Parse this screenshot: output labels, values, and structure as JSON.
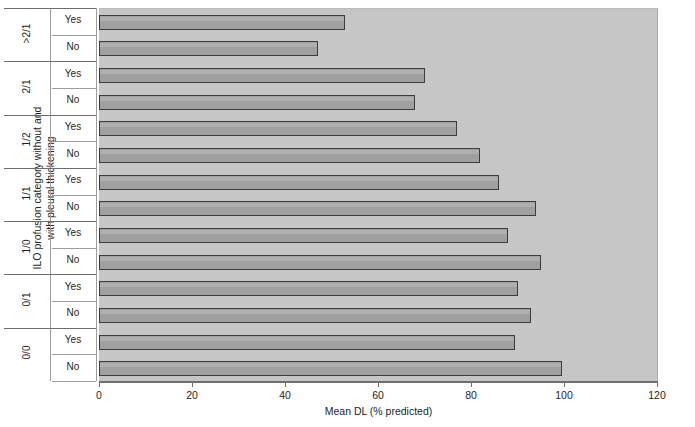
{
  "chart_data": {
    "type": "bar",
    "orientation": "horizontal",
    "title": "",
    "xlabel": "Mean DL (% predicted)",
    "ylabel": "ILO profusion category without and\nwith pleural thickening",
    "xlim": [
      0,
      120
    ],
    "xticks": [
      0,
      20,
      40,
      60,
      80,
      100,
      120
    ],
    "xticklabels": [
      "0",
      "20",
      "40",
      "60",
      "80",
      "100",
      "120"
    ],
    "grid": false,
    "legend": "none",
    "groups": [
      {
        "category": ">2/1",
        "bars": [
          {
            "label": "Yes",
            "value": 53
          },
          {
            "label": "No",
            "value": 47
          }
        ]
      },
      {
        "category": "2/1",
        "bars": [
          {
            "label": "Yes",
            "value": 70
          },
          {
            "label": "No",
            "value": 68
          }
        ]
      },
      {
        "category": "1/2",
        "bars": [
          {
            "label": "Yes",
            "value": 77
          },
          {
            "label": "No",
            "value": 82
          }
        ]
      },
      {
        "category": "1/1",
        "bars": [
          {
            "label": "Yes",
            "value": 86
          },
          {
            "label": "No",
            "value": 94
          }
        ]
      },
      {
        "category": "1/0",
        "bars": [
          {
            "label": "Yes",
            "value": 88
          },
          {
            "label": "No",
            "value": 95
          }
        ]
      },
      {
        "category": "0/1",
        "bars": [
          {
            "label": "Yes",
            "value": 90
          },
          {
            "label": "No",
            "value": 93
          }
        ]
      },
      {
        "category": "0/0",
        "bars": [
          {
            "label": "Yes",
            "value": 89.5
          },
          {
            "label": "No",
            "value": 99.5
          }
        ]
      }
    ],
    "colors": {
      "plot_background": "#c6c6c6",
      "bar_fill": "#a0a0a0",
      "bar_edge": "#3c3c3c",
      "axis": "#6f6f6f",
      "text": "#231f20"
    }
  }
}
